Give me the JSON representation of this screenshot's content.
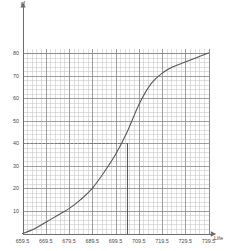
{
  "chart_data": {
    "type": "line",
    "title": "",
    "subtitle": "",
    "xlabel": "Life",
    "ylabel": "cf",
    "xlim": [
      659.5,
      739.5
    ],
    "ylim": [
      0,
      82
    ],
    "grid": true,
    "minor_grid": true,
    "legend": "none",
    "x_ticks": [
      "659.5",
      "669.5",
      "679.5",
      "689.5",
      "699.5",
      "709.5",
      "719.5",
      "729.5",
      "739.5"
    ],
    "x_tick_values": [
      659.5,
      669.5,
      679.5,
      689.5,
      699.5,
      709.5,
      719.5,
      729.5,
      739.5
    ],
    "y_ticks": [
      "10",
      "20",
      "30",
      "40",
      "50",
      "60",
      "70",
      "80"
    ],
    "y_tick_values": [
      10,
      20,
      30,
      40,
      50,
      60,
      70,
      80
    ],
    "series": [
      {
        "name": "Cumulative frequency",
        "x": [
          659.5,
          664.5,
          669.5,
          674.5,
          679.5,
          684.5,
          689.5,
          694.5,
          699.5,
          704.5,
          709.5,
          714.5,
          719.5,
          724.5,
          729.5,
          734.5,
          739.5
        ],
        "values": [
          0,
          2,
          5,
          8,
          11,
          15,
          20,
          27,
          35,
          45,
          57,
          66,
          71,
          74,
          76,
          78,
          80
        ]
      }
    ],
    "annotations": [
      {
        "kind": "horizontal-dashed-line",
        "label": "median cf level",
        "y": 40,
        "x_from": 659.5,
        "x_to": 704.5
      },
      {
        "kind": "vertical-line",
        "label": "median life",
        "x": 704.5,
        "y_from": 0,
        "y_to": 40
      }
    ],
    "colors": {
      "curve": "#555555",
      "grid_major": "#8a8a8a",
      "grid_minor": "#c9c9c9",
      "axis": "#6d6d6d",
      "annotation": "#777777",
      "text": "#4a4a4a"
    }
  }
}
